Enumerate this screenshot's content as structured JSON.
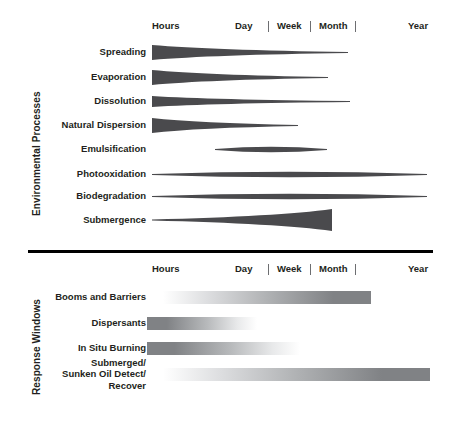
{
  "figure": {
    "title_environmental": "Environmental Processes",
    "title_response": "Response Windows",
    "colors": {
      "ink": "#231f20",
      "shape_dark": "#4a4a4d",
      "shape_mid": "#6d6e71",
      "gradient_dark": "#808285",
      "gradient_light": "#ffffff",
      "divider": "#000000"
    }
  },
  "axis": {
    "ticks": [
      {
        "label": "Hours",
        "x": 152
      },
      {
        "label": "Day",
        "x": 235
      },
      {
        "label": "Week",
        "x": 277
      },
      {
        "label": "Month",
        "x": 319
      },
      {
        "label": "Year",
        "x": 408
      }
    ],
    "separators": [
      268,
      310,
      355
    ],
    "top_y": 18,
    "bottom_y": 261
  },
  "environmental_processes": {
    "label": "Environmental Processes",
    "rows": [
      {
        "name": "Spreading",
        "label": "Spreading",
        "y": 52,
        "shape": "wedge-taper",
        "x_start": 152,
        "x_end": 348,
        "thickness_start": 15,
        "thickness_end": 1
      },
      {
        "name": "Evaporation",
        "label": "Evaporation",
        "y": 77,
        "shape": "wedge-taper",
        "x_start": 152,
        "x_end": 328,
        "thickness_start": 15,
        "thickness_end": 1
      },
      {
        "name": "Dissolution",
        "label": "Dissolution",
        "y": 101,
        "shape": "wedge-taper",
        "x_start": 152,
        "x_end": 350,
        "thickness_start": 11,
        "thickness_end": 1
      },
      {
        "name": "Natural Dispersion",
        "label": "Natural Dispersion",
        "y": 125,
        "shape": "wedge-taper",
        "x_start": 152,
        "x_end": 298,
        "thickness_start": 15,
        "thickness_end": 1
      },
      {
        "name": "Emulsification",
        "label": "Emulsification",
        "y": 149,
        "shape": "lens",
        "x_start": 215,
        "x_end": 327,
        "thickness_start": 1,
        "thickness_mid": 5,
        "thickness_end": 1
      },
      {
        "name": "Photooxidation",
        "label": "Photooxidation",
        "y": 174,
        "shape": "lens",
        "x_start": 152,
        "x_end": 427,
        "thickness_start": 1,
        "thickness_mid": 5,
        "thickness_end": 1
      },
      {
        "name": "Biodegradation",
        "label": "Biodegradation",
        "y": 196,
        "shape": "lens",
        "x_start": 152,
        "x_end": 427,
        "thickness_start": 1,
        "thickness_mid": 5,
        "thickness_end": 1
      },
      {
        "name": "Submergence",
        "label": "Submergence",
        "y": 220,
        "shape": "wedge-grow",
        "x_start": 152,
        "x_end": 332,
        "thickness_start": 1,
        "thickness_end": 22
      }
    ]
  },
  "response_windows": {
    "label": "Response Windows",
    "rows": [
      {
        "name": "Booms and Barriers",
        "label": "Booms and Barriers",
        "y": 297,
        "x_start": 163,
        "x_end": 371,
        "gradient": "light-to-dark"
      },
      {
        "name": "Dispersants",
        "label": "Dispersants",
        "y": 323,
        "x_start": 147,
        "x_end": 257,
        "gradient": "dark-to-light"
      },
      {
        "name": "In Situ Burning",
        "label": "In Situ Burning",
        "y": 348,
        "x_start": 147,
        "x_end": 300,
        "gradient": "dark-to-light"
      },
      {
        "name": "Submerged/\nSunken Oil Detect/\nRecover",
        "label": "Submerged/\nSunken Oil Detect/\nRecover",
        "y": 374,
        "x_start": 163,
        "x_end": 430,
        "gradient": "light-to-dark"
      }
    ]
  },
  "divider": {
    "x": 28,
    "y": 250,
    "width": 405,
    "height": 3
  }
}
